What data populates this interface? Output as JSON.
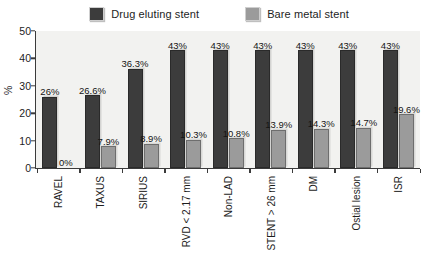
{
  "chart_data": {
    "type": "bar",
    "title": "",
    "xlabel": "",
    "ylabel": "%",
    "ylim": [
      0,
      50
    ],
    "yticks": [
      0,
      10,
      20,
      30,
      40,
      50
    ],
    "grid": false,
    "legend_position": "top-center",
    "categories": [
      "RAVEL",
      "TAXUS",
      "SIRIUS",
      "RVD < 2.17 mm",
      "Non-LAD",
      "STENT > 26 mm",
      "DM",
      "Ostial lesion",
      "ISR"
    ],
    "series": [
      {
        "name": "Drug eluting stent",
        "color": "#3c3c3c",
        "values": [
          26,
          26.6,
          36.3,
          43,
          43,
          43,
          43,
          43,
          43
        ],
        "labels": [
          "26%",
          "26.6%",
          "36.3%",
          "43%",
          "43%",
          "43%",
          "43%",
          "43%",
          "43%"
        ]
      },
      {
        "name": "Bare metal stent",
        "color": "#9b9b9b",
        "values": [
          0,
          7.9,
          8.9,
          10.3,
          10.8,
          13.9,
          14.3,
          14.7,
          19.6
        ],
        "labels": [
          "0%",
          "7.9%",
          "8.9%",
          "10.3%",
          "10.8%",
          "13.9%",
          "14.3%",
          "14.7%",
          "19.6%"
        ]
      }
    ]
  },
  "legend": {
    "items": [
      {
        "label": "Drug eluting stent",
        "color": "#3c3c3c"
      },
      {
        "label": "Bare metal stent",
        "color": "#9b9b9b"
      }
    ]
  },
  "axes": {
    "y_label": "%",
    "y_ticks": [
      "50",
      "40",
      "30",
      "20",
      "10",
      "0"
    ]
  }
}
